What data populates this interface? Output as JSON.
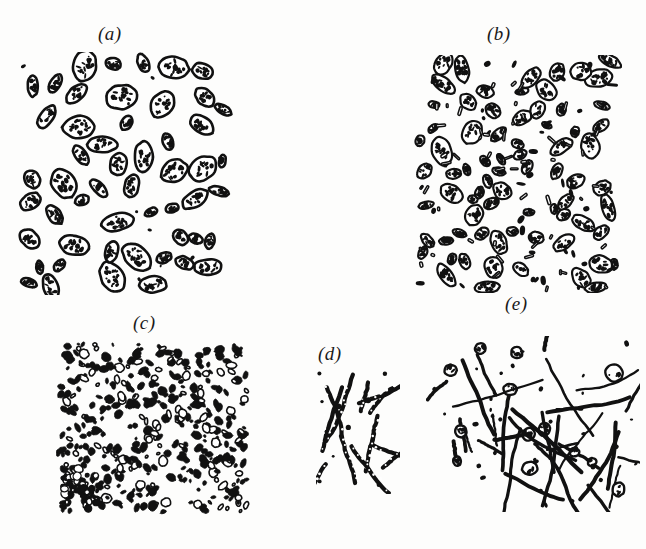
{
  "figure": {
    "background_color": "#fdfdfc",
    "ink_color": "#111111",
    "width": 646,
    "height": 549,
    "caption": ""
  },
  "panels": [
    {
      "id": "a",
      "label": "(a)",
      "label_x": 98,
      "label_y": 23,
      "description": "Sparse large stippled ovoid cells, low density",
      "box": {
        "x": 18,
        "y": 52,
        "w": 215,
        "h": 243
      },
      "style": "stippled-ovoid",
      "seed": 11,
      "cell_count": 52,
      "cell_size": {
        "min": 13,
        "max": 34
      },
      "outline_width": 2.6,
      "speck_count": 7
    },
    {
      "id": "b",
      "label": "(b)",
      "label_x": 487,
      "label_y": 23,
      "description": "Dense stippled ovoid cells interspersed with very small rods",
      "box": {
        "x": 412,
        "y": 55,
        "w": 210,
        "h": 238
      },
      "style": "stippled-ovoid-dense",
      "seed": 27,
      "cell_count": 74,
      "cell_size": {
        "min": 10,
        "max": 30
      },
      "outline_width": 2.2,
      "speck_count": 96
    },
    {
      "id": "c",
      "label": "(c)",
      "label_x": 133,
      "label_y": 312,
      "description": "Very dense field of tiny dark cocci and coccobacilli",
      "box": {
        "x": 56,
        "y": 341,
        "w": 194,
        "h": 174
      },
      "style": "tiny-dark-cocci",
      "seed": 41,
      "cell_count": 430,
      "cell_size": {
        "min": 3,
        "max": 11
      },
      "outline_width": 1.6,
      "speck_count": 0
    },
    {
      "id": "d",
      "label": "(d)",
      "label_x": 318,
      "label_y": 343,
      "description": "Few long beaded filamentous rods forming a small cluster",
      "box": {
        "x": 316,
        "y": 370,
        "w": 84,
        "h": 124
      },
      "style": "beaded-filaments",
      "seed": 59,
      "cell_count": 13,
      "cell_size": {
        "min": 26,
        "max": 74
      },
      "outline_width": 4.2,
      "speck_count": 9
    },
    {
      "id": "e",
      "label": "(e)",
      "label_x": 505,
      "label_y": 293,
      "description": "Long slender filamentous rods with scattered stippled cocci",
      "box": {
        "x": 426,
        "y": 336,
        "w": 214,
        "h": 176
      },
      "style": "long-filaments",
      "seed": 73,
      "cell_count": 46,
      "cell_size": {
        "min": 22,
        "max": 96
      },
      "outline_width": 3.0,
      "speck_count": 34
    }
  ]
}
